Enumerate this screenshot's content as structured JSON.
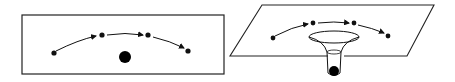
{
  "figure": {
    "panels": [
      {
        "id": "flat-space",
        "description": "Flat plane with mass; object path with 4 points and arrows",
        "point_count": 4,
        "has_central_mass": true
      },
      {
        "id": "curved-space",
        "description": "Tilted plane with funnel-shaped depression holding a mass; object path with 4 points and arrows",
        "point_count": 4,
        "has_central_mass": true
      }
    ],
    "colors": {
      "stroke": "#111111",
      "background": "#ffffff"
    }
  }
}
